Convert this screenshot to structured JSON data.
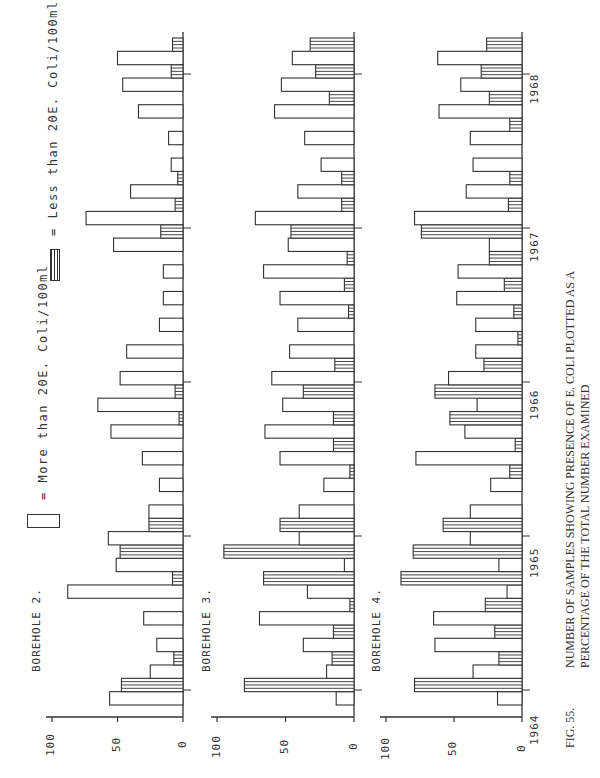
{
  "chart_data": {
    "type": "bar",
    "orientation": "rotated-90-ccw",
    "figure_label": "FIG. 55.",
    "xlabel": "",
    "ylabel": "",
    "ylim": [
      0,
      100
    ],
    "y_ticks": [
      "0",
      "50",
      "100"
    ],
    "time_ticks": [
      "1964",
      "1965",
      "1966",
      "1967",
      "1968"
    ],
    "legend": [
      {
        "pattern": "open",
        "label": "= More than 20E. Coli/100ml"
      },
      {
        "pattern": "hatched",
        "label": "= Less than 20E. Coli/100ml"
      }
    ],
    "panels": [
      {
        "name": "BOREHOLE 2.",
        "bars": [
          {
            "type": "open",
            "value": 56
          },
          {
            "type": "hatched",
            "value": 47
          },
          {
            "type": "open",
            "value": 25
          },
          {
            "type": "hatched",
            "value": 7
          },
          {
            "type": "open",
            "value": 20
          },
          {
            "type": "hatched",
            "value": 0
          },
          {
            "type": "open",
            "value": 30
          },
          {
            "type": "hatched",
            "value": 0
          },
          {
            "type": "open",
            "value": 88
          },
          {
            "type": "hatched",
            "value": 8
          },
          {
            "type": "open",
            "value": 51
          },
          {
            "type": "hatched",
            "value": 48
          },
          {
            "type": "open",
            "value": 57
          },
          {
            "type": "hatched",
            "value": 26
          },
          {
            "type": "open",
            "value": 26
          },
          {
            "type": "hatched",
            "value": 0
          },
          {
            "type": "open",
            "value": 18
          },
          {
            "type": "hatched",
            "value": 0
          },
          {
            "type": "open",
            "value": 31
          },
          {
            "type": "hatched",
            "value": 0
          },
          {
            "type": "open",
            "value": 55
          },
          {
            "type": "hatched",
            "value": 3
          },
          {
            "type": "open",
            "value": 65
          },
          {
            "type": "hatched",
            "value": 6
          },
          {
            "type": "open",
            "value": 48
          },
          {
            "type": "hatched",
            "value": 0
          },
          {
            "type": "open",
            "value": 43
          },
          {
            "type": "hatched",
            "value": 0
          },
          {
            "type": "open",
            "value": 18
          },
          {
            "type": "hatched",
            "value": 0
          },
          {
            "type": "open",
            "value": 15
          },
          {
            "type": "hatched",
            "value": 0
          },
          {
            "type": "open",
            "value": 15
          },
          {
            "type": "hatched",
            "value": 0
          },
          {
            "type": "open",
            "value": 53
          },
          {
            "type": "hatched",
            "value": 17
          },
          {
            "type": "open",
            "value": 74
          },
          {
            "type": "hatched",
            "value": 6
          },
          {
            "type": "open",
            "value": 40
          },
          {
            "type": "hatched",
            "value": 4
          },
          {
            "type": "open",
            "value": 9
          },
          {
            "type": "hatched",
            "value": 0
          },
          {
            "type": "open",
            "value": 11
          },
          {
            "type": "hatched",
            "value": 0
          },
          {
            "type": "open",
            "value": 34
          },
          {
            "type": "hatched",
            "value": 0
          },
          {
            "type": "open",
            "value": 46
          },
          {
            "type": "hatched",
            "value": 9
          },
          {
            "type": "open",
            "value": 50
          },
          {
            "type": "hatched",
            "value": 8
          }
        ]
      },
      {
        "name": "BOREHOLE 3.",
        "bars": [
          {
            "type": "open",
            "value": 13
          },
          {
            "type": "hatched",
            "value": 80
          },
          {
            "type": "open",
            "value": 20
          },
          {
            "type": "hatched",
            "value": 16
          },
          {
            "type": "open",
            "value": 37
          },
          {
            "type": "hatched",
            "value": 15
          },
          {
            "type": "open",
            "value": 69
          },
          {
            "type": "hatched",
            "value": 3
          },
          {
            "type": "open",
            "value": 34
          },
          {
            "type": "hatched",
            "value": 66
          },
          {
            "type": "open",
            "value": 7
          },
          {
            "type": "hatched",
            "value": 95
          },
          {
            "type": "open",
            "value": 40
          },
          {
            "type": "hatched",
            "value": 54
          },
          {
            "type": "open",
            "value": 40
          },
          {
            "type": "hatched",
            "value": 0
          },
          {
            "type": "open",
            "value": 22
          },
          {
            "type": "hatched",
            "value": 3
          },
          {
            "type": "open",
            "value": 54
          },
          {
            "type": "hatched",
            "value": 15
          },
          {
            "type": "open",
            "value": 65
          },
          {
            "type": "hatched",
            "value": 15
          },
          {
            "type": "open",
            "value": 52
          },
          {
            "type": "hatched",
            "value": 37
          },
          {
            "type": "open",
            "value": 60
          },
          {
            "type": "hatched",
            "value": 14
          },
          {
            "type": "open",
            "value": 47
          },
          {
            "type": "hatched",
            "value": 0
          },
          {
            "type": "open",
            "value": 41
          },
          {
            "type": "hatched",
            "value": 4
          },
          {
            "type": "open",
            "value": 54
          },
          {
            "type": "hatched",
            "value": 7
          },
          {
            "type": "open",
            "value": 66
          },
          {
            "type": "hatched",
            "value": 5
          },
          {
            "type": "open",
            "value": 48
          },
          {
            "type": "hatched",
            "value": 46
          },
          {
            "type": "open",
            "value": 72
          },
          {
            "type": "hatched",
            "value": 9
          },
          {
            "type": "open",
            "value": 41
          },
          {
            "type": "hatched",
            "value": 9
          },
          {
            "type": "open",
            "value": 24
          },
          {
            "type": "hatched",
            "value": 0
          },
          {
            "type": "open",
            "value": 36
          },
          {
            "type": "hatched",
            "value": 0
          },
          {
            "type": "open",
            "value": 58
          },
          {
            "type": "hatched",
            "value": 18
          },
          {
            "type": "open",
            "value": 53
          },
          {
            "type": "hatched",
            "value": 28
          },
          {
            "type": "open",
            "value": 45
          },
          {
            "type": "hatched",
            "value": 32
          }
        ]
      },
      {
        "name": "BOREHOLE 4.",
        "bars": [
          {
            "type": "open",
            "value": 18
          },
          {
            "type": "hatched",
            "value": 79
          },
          {
            "type": "open",
            "value": 36
          },
          {
            "type": "hatched",
            "value": 17
          },
          {
            "type": "open",
            "value": 64
          },
          {
            "type": "hatched",
            "value": 20
          },
          {
            "type": "open",
            "value": 65
          },
          {
            "type": "hatched",
            "value": 27
          },
          {
            "type": "open",
            "value": 11
          },
          {
            "type": "hatched",
            "value": 89
          },
          {
            "type": "open",
            "value": 17
          },
          {
            "type": "hatched",
            "value": 80
          },
          {
            "type": "open",
            "value": 38
          },
          {
            "type": "hatched",
            "value": 58
          },
          {
            "type": "open",
            "value": 38
          },
          {
            "type": "hatched",
            "value": 0
          },
          {
            "type": "open",
            "value": 23
          },
          {
            "type": "hatched",
            "value": 9
          },
          {
            "type": "open",
            "value": 78
          },
          {
            "type": "hatched",
            "value": 5
          },
          {
            "type": "open",
            "value": 42
          },
          {
            "type": "hatched",
            "value": 53
          },
          {
            "type": "open",
            "value": 33
          },
          {
            "type": "hatched",
            "value": 64
          },
          {
            "type": "open",
            "value": 54
          },
          {
            "type": "hatched",
            "value": 28
          },
          {
            "type": "open",
            "value": 34
          },
          {
            "type": "hatched",
            "value": 3
          },
          {
            "type": "open",
            "value": 34
          },
          {
            "type": "hatched",
            "value": 6
          },
          {
            "type": "open",
            "value": 48
          },
          {
            "type": "hatched",
            "value": 13
          },
          {
            "type": "open",
            "value": 47
          },
          {
            "type": "hatched",
            "value": 24
          },
          {
            "type": "open",
            "value": 24
          },
          {
            "type": "hatched",
            "value": 74
          },
          {
            "type": "open",
            "value": 79
          },
          {
            "type": "hatched",
            "value": 10
          },
          {
            "type": "open",
            "value": 41
          },
          {
            "type": "hatched",
            "value": 9
          },
          {
            "type": "open",
            "value": 36
          },
          {
            "type": "hatched",
            "value": 0
          },
          {
            "type": "open",
            "value": 38
          },
          {
            "type": "hatched",
            "value": 9
          },
          {
            "type": "open",
            "value": 61
          },
          {
            "type": "hatched",
            "value": 24
          },
          {
            "type": "open",
            "value": 45
          },
          {
            "type": "hatched",
            "value": 30
          },
          {
            "type": "open",
            "value": 62
          },
          {
            "type": "hatched",
            "value": 26
          }
        ]
      }
    ]
  },
  "legend": {
    "open_label": "= More than  20E. Coli/100ml",
    "hatched_label": "= Less than  20E. Coli/100ml"
  },
  "panels": [
    {
      "label": "BOREHOLE   2."
    },
    {
      "label": "BOREHOLE   3."
    },
    {
      "label": "BOREHOLE   4."
    }
  ],
  "axis": {
    "t0": "0",
    "t50": "50",
    "t100": "100"
  },
  "years": [
    "1964",
    "1965",
    "1966",
    "1967",
    "1968"
  ],
  "caption": {
    "fig": "FIG.  55.",
    "line1": "NUMBER OF SAMPLES SHOWING PRESENCE OF E. COLI PLOTTED AS A",
    "line2": "PERCENTAGE OF THE TOTAL NUMBER EXAMINED"
  }
}
